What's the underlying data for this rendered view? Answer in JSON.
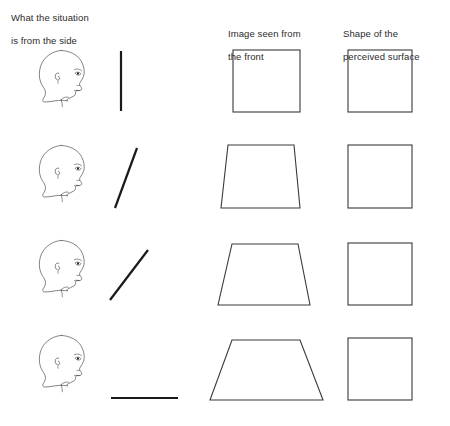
{
  "figure": {
    "title_columns": [
      {
        "id": "side",
        "line1": "What the situation",
        "line2": "is from the side"
      },
      {
        "id": "front",
        "line1": "Image seen from",
        "line2": "the front"
      },
      {
        "id": "shape",
        "line1": "Shape of the",
        "line2": "perceived surface"
      }
    ],
    "background_color": "#ffffff",
    "stroke_color": "#1a1a1a",
    "rows": [
      {
        "index": 1,
        "observer": "head-profile-facing-right",
        "surface_line": {
          "orientation": "vertical",
          "angle_deg": 90,
          "description": "surface perpendicular to line of sight"
        },
        "retinal_image": {
          "shape": "square",
          "top_width": 68,
          "bottom_width": 68
        },
        "perceived_shape": {
          "shape": "square",
          "side": 64
        }
      },
      {
        "index": 2,
        "observer": "head-profile-facing-right",
        "surface_line": {
          "orientation": "slight-slant",
          "angle_deg": 70,
          "description": "surface slanted slightly away"
        },
        "retinal_image": {
          "shape": "trapezoid",
          "top_width": 62,
          "bottom_width": 72
        },
        "perceived_shape": {
          "shape": "square",
          "side": 64
        }
      },
      {
        "index": 3,
        "observer": "head-profile-facing-right",
        "surface_line": {
          "orientation": "diagonal",
          "angle_deg": 45,
          "description": "surface slanted at 45 degrees"
        },
        "retinal_image": {
          "shape": "trapezoid",
          "top_width": 66,
          "bottom_width": 86
        },
        "perceived_shape": {
          "shape": "square",
          "side": 64
        }
      },
      {
        "index": 4,
        "observer": "head-profile-facing-right",
        "surface_line": {
          "orientation": "horizontal",
          "angle_deg": 0,
          "description": "surface receding flat from the eye"
        },
        "retinal_image": {
          "shape": "trapezoid",
          "top_width": 70,
          "bottom_width": 110
        },
        "perceived_shape": {
          "shape": "square",
          "side": 64
        }
      }
    ]
  }
}
